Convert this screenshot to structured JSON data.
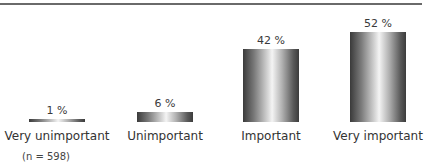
{
  "chart_data": {
    "type": "bar",
    "title": "",
    "xlabel": "",
    "ylabel": "",
    "categories": [
      "Very unimportant",
      "Unimportant",
      "Important",
      "Very important"
    ],
    "values": [
      1,
      6,
      42,
      52
    ],
    "value_labels": [
      "1 %",
      "6 %",
      "42 %",
      "52 %"
    ],
    "unit": "%",
    "ylim": [
      0,
      60
    ],
    "grid": false,
    "legend": null,
    "annotations": [
      "(n = 598)"
    ],
    "bar_style": "cylindrical gray gradient"
  },
  "note": "(n = 598)"
}
